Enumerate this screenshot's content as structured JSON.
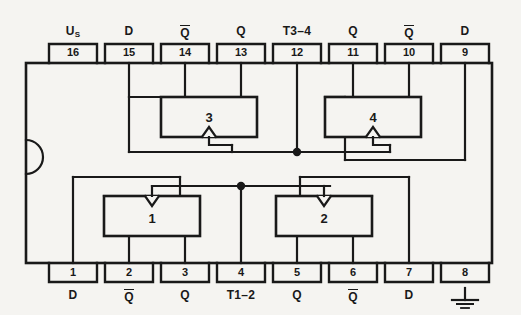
{
  "diagram": {
    "package": {
      "type": "dual-in-line",
      "pin_count": 16,
      "notch": "semicircle-left"
    },
    "colors": {
      "background": "#f5f4f1",
      "line": "#191919",
      "fill": "#f5f4f1"
    },
    "top_pins": [
      {
        "number": "16",
        "signal": "U",
        "subscript": "S",
        "style": "sub"
      },
      {
        "number": "15",
        "signal": "D",
        "style": "plain"
      },
      {
        "number": "14",
        "signal": "Q",
        "style": "overline"
      },
      {
        "number": "13",
        "signal": "Q",
        "style": "plain"
      },
      {
        "number": "12",
        "signal": "T3–4",
        "style": "plain"
      },
      {
        "number": "11",
        "signal": "Q",
        "style": "plain"
      },
      {
        "number": "10",
        "signal": "Q",
        "style": "overline"
      },
      {
        "number": "9",
        "signal": "D",
        "style": "plain"
      }
    ],
    "bottom_pins": [
      {
        "number": "1",
        "signal": "D",
        "style": "plain"
      },
      {
        "number": "2",
        "signal": "Q",
        "style": "overline"
      },
      {
        "number": "3",
        "signal": "Q",
        "style": "plain"
      },
      {
        "number": "4",
        "signal": "T1–2",
        "style": "plain"
      },
      {
        "number": "5",
        "signal": "Q",
        "style": "plain"
      },
      {
        "number": "6",
        "signal": "Q",
        "style": "overline"
      },
      {
        "number": "7",
        "signal": "D",
        "style": "plain"
      },
      {
        "number": "8",
        "signal": "",
        "style": "ground"
      }
    ],
    "flipflops": [
      {
        "label": "1",
        "position": "bottom-left",
        "clock_edge": "down-triangle"
      },
      {
        "label": "2",
        "position": "bottom-right",
        "clock_edge": "down-triangle"
      },
      {
        "label": "3",
        "position": "top-left",
        "clock_edge": "up-triangle"
      },
      {
        "label": "4",
        "position": "top-right",
        "clock_edge": "up-triangle"
      }
    ],
    "junctions": [
      {
        "name": "clock-bus-t3-4",
        "pin": "12"
      },
      {
        "name": "clock-bus-t1-2",
        "pin": "4"
      }
    ]
  }
}
